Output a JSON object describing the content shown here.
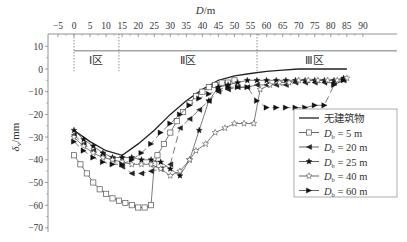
{
  "chart_data": {
    "type": "line",
    "title": "",
    "xlabel": "D/m",
    "ylabel": "δv/mm",
    "xlim": [
      -7,
      93
    ],
    "ylim": [
      -72,
      14
    ],
    "x_ticks": [
      -5,
      0,
      5,
      10,
      15,
      20,
      25,
      30,
      35,
      40,
      45,
      50,
      55,
      60,
      65,
      70,
      75,
      80,
      85,
      90
    ],
    "y_ticks": [
      10,
      0,
      -10,
      -20,
      -30,
      -40,
      -50,
      -60,
      -70
    ],
    "x_axis_position": "top",
    "regions": [
      {
        "label": "Ⅰ区",
        "from": 0,
        "to": 14
      },
      {
        "label": "Ⅱ区",
        "from": 14,
        "to": 57
      },
      {
        "label": "Ⅲ区",
        "from": 57,
        "to": 93
      }
    ],
    "region_line_y": 8,
    "legend_position": "lower right",
    "series": [
      {
        "name": "无建筑物",
        "marker": "none",
        "dash": "solid",
        "x": [
          0,
          5,
          10,
          15,
          20,
          25,
          30,
          35,
          40,
          45,
          50,
          55,
          60,
          65,
          70,
          75,
          80,
          85
        ],
        "y": [
          -27,
          -32,
          -36,
          -38,
          -33,
          -27,
          -20,
          -14,
          -9,
          -5,
          -3,
          -2,
          -1,
          -0.5,
          0,
          0,
          0,
          0
        ]
      },
      {
        "name": "Db = 5 m",
        "marker": "square-open",
        "dash": "solid",
        "x": [
          0,
          2,
          4,
          6,
          8,
          10,
          12,
          14,
          16,
          18,
          20,
          22,
          24,
          25,
          26,
          28,
          30,
          32,
          34,
          36,
          38,
          40,
          42,
          44,
          46,
          48,
          50
        ],
        "y": [
          -38,
          -42,
          -46,
          -50,
          -53,
          -55,
          -57,
          -58,
          -59,
          -60,
          -61,
          -61,
          -60,
          -42,
          -38,
          -33,
          -28,
          -23,
          -19,
          -15,
          -12,
          -10,
          -8,
          -7,
          -6,
          -6,
          -5
        ]
      },
      {
        "name": "Db = 20 m",
        "marker": "triangle-left",
        "dash": "dashed",
        "x": [
          0,
          3,
          6,
          9,
          12,
          15,
          18,
          21,
          24,
          27,
          30,
          33,
          36,
          39,
          42,
          45,
          48,
          51,
          54,
          57,
          60,
          63,
          66,
          69,
          72,
          75,
          78,
          81,
          84
        ],
        "y": [
          -29,
          -33,
          -36,
          -38,
          -40,
          -43,
          -46,
          -46,
          -45,
          -44,
          -42,
          -26,
          -22,
          -18,
          -14,
          -10,
          -9,
          -8,
          -8,
          -7,
          -7,
          -7,
          -7,
          -6,
          -6,
          -6,
          -6,
          -6,
          -5
        ]
      },
      {
        "name": "Db = 25 m",
        "marker": "star-filled",
        "dash": "solid",
        "x": [
          0,
          3,
          6,
          9,
          12,
          15,
          18,
          21,
          24,
          27,
          30,
          33,
          36,
          39,
          42,
          45,
          48,
          51,
          54,
          57,
          60,
          63,
          66,
          69,
          72,
          75,
          78,
          81,
          84
        ],
        "y": [
          -27,
          -31,
          -34,
          -37,
          -39,
          -39,
          -39,
          -40,
          -40,
          -41,
          -44,
          -47,
          -40,
          -27,
          -14,
          -8,
          -7,
          -6,
          -5,
          -5,
          -5,
          -5,
          -5,
          -5,
          -5,
          -5,
          -5,
          -5,
          -4
        ]
      },
      {
        "name": "Db = 40 m",
        "marker": "star-open",
        "dash": "solid",
        "x": [
          0,
          3,
          6,
          9,
          12,
          15,
          18,
          21,
          24,
          27,
          30,
          33,
          36,
          38,
          41,
          44,
          47,
          50,
          53,
          56,
          58,
          61,
          64,
          67,
          70,
          73,
          76,
          79,
          82,
          85
        ],
        "y": [
          -30,
          -34,
          -37,
          -39,
          -40,
          -41,
          -42,
          -42,
          -42,
          -44,
          -47,
          -45,
          -40,
          -36,
          -33,
          -28,
          -26,
          -24,
          -24,
          -24,
          -9,
          -7,
          -6,
          -6,
          -5,
          -5,
          -5,
          -5,
          -5,
          -4
        ]
      },
      {
        "name": "Db = 60 m",
        "marker": "triangle-right",
        "dash": "dashed",
        "x": [
          0,
          3,
          6,
          9,
          12,
          15,
          18,
          21,
          24,
          27,
          30,
          33,
          36,
          39,
          42,
          45,
          48,
          51,
          54,
          57,
          60,
          63,
          66,
          69,
          72,
          75,
          78,
          81,
          84
        ],
        "y": [
          -32,
          -36,
          -39,
          -41,
          -42,
          -42,
          -40,
          -37,
          -33,
          -28,
          -24,
          -20,
          -16,
          -13,
          -11,
          -9,
          -8,
          -8,
          -8,
          -14,
          -17,
          -17,
          -17,
          -17,
          -17,
          -16,
          -16,
          -7,
          -5
        ]
      }
    ]
  }
}
